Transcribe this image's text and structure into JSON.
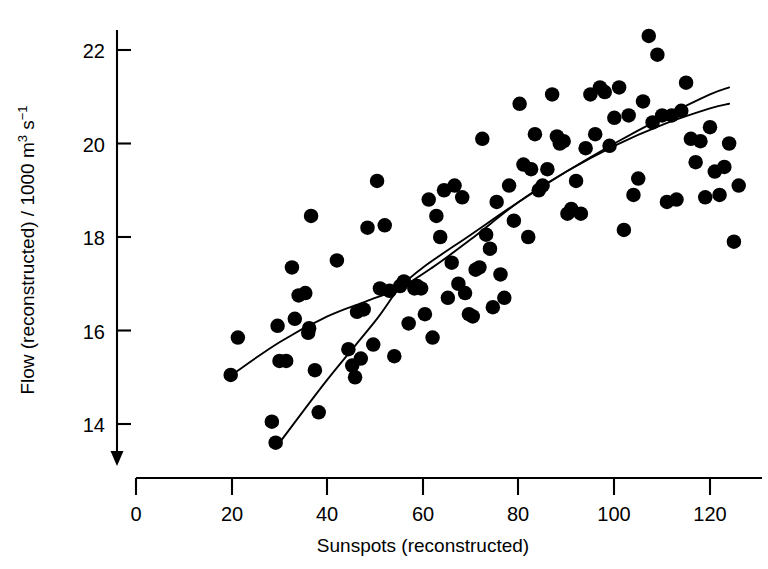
{
  "figure": {
    "background_color": "#ffffff",
    "ink_color": "#000000",
    "marker_color": "#000000"
  },
  "chart_data": {
    "type": "scatter",
    "title": "",
    "subtitle": "",
    "xlabel": "Sunspots (reconstructed)",
    "ylabel": "Flow (reconstructed) / 1000 m³ s⁻¹",
    "ylabel_parts": {
      "main": "Flow (reconstructed) / 1000 m",
      "sup1": "3",
      "mid": " s",
      "sup2": "−1"
    },
    "xlim": [
      0,
      128
    ],
    "ylim": [
      13.2,
      22.7
    ],
    "xticks": [
      0,
      20,
      40,
      60,
      80,
      100,
      120
    ],
    "xticklabels": [
      "0",
      "20",
      "40",
      "60",
      "80",
      "100",
      "120"
    ],
    "yticks": [
      14,
      16,
      18,
      20,
      22
    ],
    "yticklabels": [
      "14",
      "16",
      "18",
      "20",
      "22"
    ],
    "grid": false,
    "legend": null,
    "legend_position": "none",
    "axis_style": "L-shaped spines with downward arrow on y-axis",
    "marker_style": "filled circle",
    "marker_diameter_px": 14.5,
    "x": [
      19.8,
      21.3,
      28.4,
      29.2,
      29.6,
      30.0,
      31.4,
      32.6,
      33.2,
      34.0,
      35.4,
      36.0,
      36.2,
      36.6,
      37.4,
      38.2,
      42.0,
      44.4,
      45.2,
      45.8,
      46.2,
      47.0,
      47.6,
      48.4,
      49.6,
      50.4,
      51.0,
      52.0,
      53.0,
      54.0,
      55.2,
      56.0,
      57.0,
      58.2,
      58.8,
      59.6,
      60.4,
      61.2,
      62.0,
      62.8,
      63.6,
      64.4,
      65.2,
      66.0,
      66.6,
      67.4,
      68.2,
      68.8,
      69.6,
      70.4,
      71.0,
      71.8,
      72.4,
      73.2,
      74.0,
      74.6,
      75.4,
      76.2,
      77.0,
      78.0,
      79.0,
      80.2,
      81.0,
      82.0,
      82.6,
      83.4,
      84.2,
      85.0,
      86.0,
      87.0,
      88.0,
      88.6,
      89.4,
      90.2,
      91.0,
      92.0,
      93.0,
      94.0,
      95.0,
      96.0,
      97.0,
      98.0,
      99.0,
      100.0,
      101.0,
      102.0,
      103.0,
      104.0,
      105.0,
      106.0,
      107.2,
      108.0,
      109.0,
      110.0,
      111.0,
      112.0,
      113.0,
      114.0,
      115.0,
      116.0,
      117.0,
      118.0,
      119.0,
      120.0,
      121.0,
      122.0,
      123.0,
      124.0,
      125.0,
      126.0
    ],
    "y": [
      15.05,
      15.85,
      14.05,
      13.6,
      16.1,
      15.35,
      15.35,
      17.35,
      16.25,
      16.75,
      16.8,
      15.95,
      16.05,
      18.45,
      15.15,
      14.25,
      17.5,
      15.6,
      15.25,
      15.0,
      16.4,
      15.4,
      16.45,
      18.2,
      15.7,
      19.2,
      16.9,
      18.25,
      16.85,
      15.45,
      16.95,
      17.05,
      16.15,
      16.9,
      16.95,
      16.9,
      16.35,
      18.8,
      15.85,
      18.45,
      18.0,
      19.0,
      16.7,
      17.45,
      19.1,
      17.0,
      18.85,
      16.8,
      16.35,
      16.3,
      17.3,
      17.35,
      20.1,
      18.05,
      17.75,
      16.5,
      18.75,
      17.2,
      16.7,
      19.1,
      18.35,
      20.85,
      19.55,
      18.0,
      19.45,
      20.2,
      19.0,
      19.1,
      19.45,
      21.05,
      20.15,
      20.0,
      20.05,
      18.5,
      18.6,
      19.2,
      18.5,
      19.9,
      21.05,
      20.2,
      21.2,
      21.1,
      19.95,
      20.55,
      21.2,
      18.15,
      20.6,
      18.9,
      19.25,
      20.9,
      22.3,
      20.45,
      21.9,
      20.6,
      18.75,
      20.6,
      18.8,
      20.7,
      21.3,
      20.1,
      19.6,
      20.05,
      18.85,
      20.35,
      19.4,
      18.9,
      19.5,
      20.0,
      17.9,
      19.1
    ],
    "series": [
      {
        "name": "data",
        "type": "scatter",
        "marker": "filled-circle",
        "color": "#000000"
      },
      {
        "name": "lowess-smooth",
        "type": "line",
        "color": "#000000",
        "points_x": [
          20,
          30,
          40,
          48,
          55,
          62,
          70,
          80,
          90,
          100,
          110,
          120,
          124
        ],
        "points_y": [
          15.05,
          15.75,
          16.3,
          16.62,
          16.9,
          17.35,
          17.95,
          18.75,
          19.4,
          19.95,
          20.4,
          20.75,
          20.85
        ]
      },
      {
        "name": "regression-fit",
        "type": "line",
        "color": "#000000",
        "points_x": [
          30,
          40,
          50,
          55,
          60,
          70,
          80,
          90,
          100,
          110,
          120,
          124
        ],
        "points_y": [
          13.6,
          14.95,
          16.2,
          16.9,
          17.35,
          18.05,
          18.75,
          19.4,
          20.0,
          20.55,
          21.05,
          21.2
        ]
      }
    ]
  }
}
